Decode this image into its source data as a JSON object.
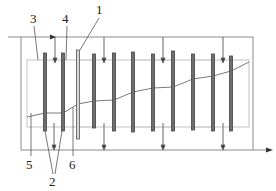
{
  "diagram": {
    "type": "schematic",
    "labels": [
      {
        "id": "1",
        "text": "1",
        "x": 96,
        "y": 3
      },
      {
        "id": "2",
        "text": "2",
        "x": 49,
        "y": 175
      },
      {
        "id": "3",
        "text": "3",
        "x": 30,
        "y": 11
      },
      {
        "id": "4",
        "text": "4",
        "x": 62,
        "y": 11
      },
      {
        "id": "5",
        "text": "5",
        "x": 26,
        "y": 157
      },
      {
        "id": "6",
        "text": "6",
        "x": 69,
        "y": 157
      }
    ],
    "colors": {
      "line": "#8a8a8a",
      "inner_box": "#bdbdbd",
      "rod_fill": "#6e6e6e",
      "rod_light": "#c8c8c8",
      "text": "#222222"
    }
  }
}
